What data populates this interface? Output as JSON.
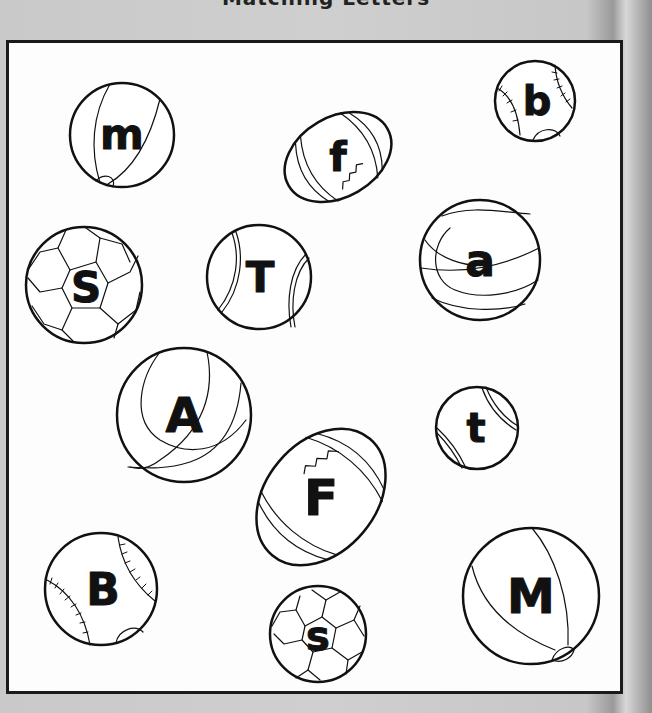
{
  "page": {
    "title_cutoff": "Matching Letters",
    "background_color": "#c8c8c8",
    "box_border_color": "#1a1a1a"
  },
  "balls": [
    {
      "id": "ball-m",
      "type": "beach-ball",
      "letter": "m",
      "cx": 122,
      "cy": 135,
      "r": 52
    },
    {
      "id": "ball-f",
      "type": "football",
      "letter": "f",
      "cx": 338,
      "cy": 157,
      "rx": 57,
      "ry": 44,
      "rotate": -30
    },
    {
      "id": "ball-b",
      "type": "baseball",
      "letter": "b",
      "cx": 535,
      "cy": 101,
      "r": 40
    },
    {
      "id": "ball-S",
      "type": "soccer-ball",
      "letter": "S",
      "cx": 84,
      "cy": 285,
      "r": 58
    },
    {
      "id": "ball-T",
      "type": "tennis-ball",
      "letter": "T",
      "cx": 259,
      "cy": 277,
      "r": 52
    },
    {
      "id": "ball-a",
      "type": "basketball",
      "letter": "a",
      "cx": 480,
      "cy": 260,
      "r": 60
    },
    {
      "id": "ball-A",
      "type": "tennis-ball-alt",
      "letter": "A",
      "cx": 184,
      "cy": 415,
      "r": 67
    },
    {
      "id": "ball-t",
      "type": "tennis-ball",
      "letter": "t",
      "cx": 477,
      "cy": 428,
      "r": 41
    },
    {
      "id": "ball-F",
      "type": "football",
      "letter": "F",
      "cx": 321,
      "cy": 497,
      "rx": 76,
      "ry": 59,
      "rotate": -50
    },
    {
      "id": "ball-B",
      "type": "baseball",
      "letter": "B",
      "cx": 101,
      "cy": 589,
      "r": 56
    },
    {
      "id": "ball-s",
      "type": "soccer-ball",
      "letter": "s",
      "cx": 318,
      "cy": 634,
      "r": 48
    },
    {
      "id": "ball-M",
      "type": "beach-ball",
      "letter": "M",
      "cx": 531,
      "cy": 596,
      "r": 68
    }
  ]
}
